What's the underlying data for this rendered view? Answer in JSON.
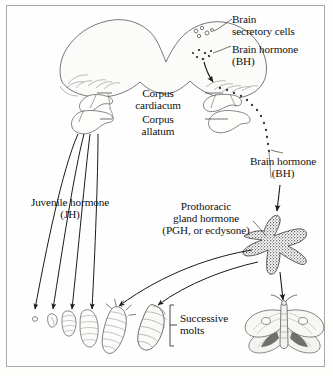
{
  "figure": {
    "border_color": "#a8a8a8",
    "background_color": "#fefefe",
    "ink_color": "#111111",
    "width": 333,
    "height": 376
  },
  "labels": {
    "brain_secretory_cells": "Brain\nsecretory cells",
    "brain_hormone_top": "Brain hormone\n(BH)",
    "corpus_cardiacum": "Corpus\ncardiacum",
    "corpus_allatum": "Corpus\nallatum",
    "brain_hormone_right": "Brain hormone\n(BH)",
    "juvenile_hormone": "Juvenile hormone\n(JH)",
    "prothoracic_gland_hormone": "Prothoracic\ngland hormone\n(PGH, or ecdysone)",
    "successive_molts": "Successive\nmolts"
  },
  "structures": [
    {
      "name": "brain",
      "label": "Brain (bilobed)",
      "description": "Large bilobed outlined brain at top of figure"
    },
    {
      "name": "brain-secretory-cells",
      "label": "Brain secretory cells",
      "description": "Small open circles inside right brain lobe"
    },
    {
      "name": "brain-hormone-granules",
      "label": "Brain hormone (BH) granules",
      "description": "Small filled dots below the secretory cells"
    },
    {
      "name": "corpus-cardiacum",
      "label": "Corpus cardiacum",
      "description": "Paired lobe below brain, left and right"
    },
    {
      "name": "corpus-allatum",
      "label": "Corpus allatum",
      "description": "Rounded paired body below corpus cardiacum"
    },
    {
      "name": "prothoracic-gland",
      "label": "Prothoracic gland",
      "description": "Stippled branched star-shaped gland"
    }
  ],
  "life_stages": [
    {
      "name": "egg",
      "label": "Egg"
    },
    {
      "name": "larva-instar-1",
      "label": "First instar larva"
    },
    {
      "name": "larva-instar-2",
      "label": "Second instar larva"
    },
    {
      "name": "larva-instar-3",
      "label": "Third instar larva"
    },
    {
      "name": "larva-instar-4",
      "label": "Fourth instar larva"
    },
    {
      "name": "pupa",
      "label": "Pupa"
    },
    {
      "name": "adult-moth",
      "label": "Adult moth"
    }
  ],
  "flows": [
    {
      "name": "bh-transport",
      "label": "Brain hormone transported via dotted path to prothoracic gland",
      "style": "dotted"
    },
    {
      "name": "jh-arrows",
      "label": "Juvenile hormone acts on successive larval stages",
      "count": 4,
      "style": "solid-arrow"
    },
    {
      "name": "pgh-arrows",
      "label": "Prothoracic gland hormone triggers molts",
      "count": 2,
      "style": "curved-arrow"
    },
    {
      "name": "pgh-to-adult",
      "label": "Prothoracic gland hormone to adult moth",
      "count": 1,
      "style": "solid-arrow"
    }
  ]
}
